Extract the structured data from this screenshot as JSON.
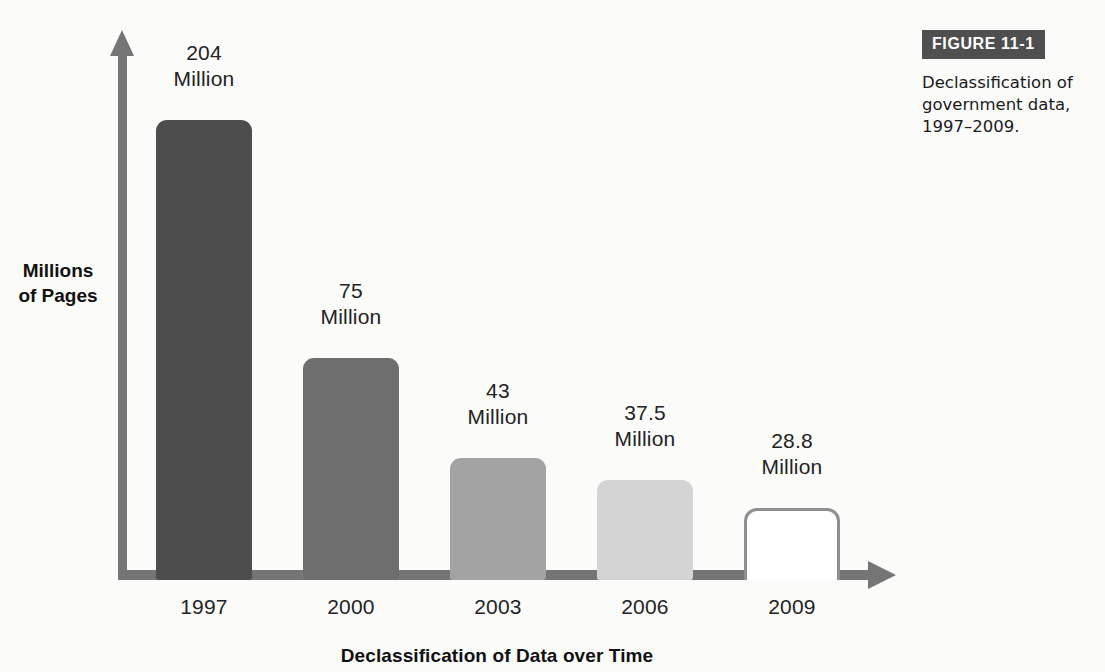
{
  "figure": {
    "badge_label": "FIGURE 11-1",
    "caption": "Declassification of government data, 1997–2009."
  },
  "chart_data": {
    "type": "bar",
    "title": "",
    "xlabel": "Declassification of Data over Time",
    "ylabel": "Millions\nof Pages",
    "categories": [
      "1997",
      "2000",
      "2003",
      "2006",
      "2009"
    ],
    "values": [
      204,
      75,
      43,
      37.5,
      28.8
    ],
    "value_labels": [
      "204\nMillion",
      "75\nMillion",
      "43\nMillion",
      "37.5\nMillion",
      "28.8\nMillion"
    ],
    "unit": "Million",
    "ylim": [
      0,
      204
    ],
    "grid": false,
    "legend": false,
    "bar_colors": [
      "#4d4d4d",
      "#6e6e6e",
      "#a3a3a3",
      "#d4d4d4",
      "#ffffff"
    ],
    "bar_outline_colors": [
      "none",
      "none",
      "none",
      "none",
      "#8f8f8f"
    ],
    "axis_color": "#757575",
    "background": "#fbfbfa",
    "bars": [
      {
        "category": "1997",
        "value": 204,
        "label": "204\nMillion",
        "color": "#4d4d4d",
        "outlined": false,
        "x": 156,
        "width": 96,
        "height": 460,
        "label_x": 140,
        "label_y": 40
      },
      {
        "category": "2000",
        "value": 75,
        "label": "75\nMillion",
        "color": "#6e6e6e",
        "outlined": false,
        "x": 303,
        "width": 96,
        "height": 222,
        "label_x": 287,
        "label_y": 278
      },
      {
        "category": "2003",
        "value": 43,
        "label": "43\nMillion",
        "color": "#a3a3a3",
        "outlined": false,
        "x": 450,
        "width": 96,
        "height": 122,
        "label_x": 434,
        "label_y": 378
      },
      {
        "category": "2006",
        "value": 37.5,
        "label": "37.5\nMillion",
        "color": "#d4d4d4",
        "outlined": false,
        "x": 597,
        "width": 96,
        "height": 100,
        "label_x": 581,
        "label_y": 400
      },
      {
        "category": "2009",
        "value": 28.8,
        "label": "28.8\nMillion",
        "color": "#ffffff",
        "outlined": true,
        "x": 744,
        "width": 96,
        "height": 72,
        "label_x": 728,
        "label_y": 428
      }
    ],
    "year_label_positions": [
      140,
      287,
      434,
      581,
      728
    ]
  }
}
